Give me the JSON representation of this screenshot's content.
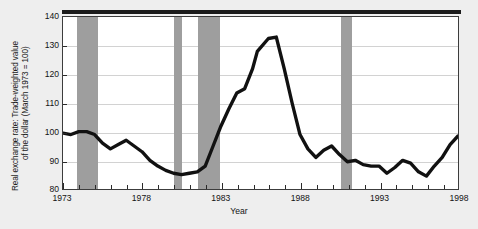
{
  "chart_data": {
    "type": "line",
    "title": "",
    "xlabel": "Year",
    "ylabel": "Real exchange rate: Trade-weighted value of the dollar (March 1973 = 100)",
    "ylabel_line1": "Real exchange rate: Trade-weighted value",
    "ylabel_line2": "of the dollar (March 1973 = 100)",
    "xlim": [
      1973,
      1998
    ],
    "ylim": [
      80,
      140
    ],
    "yticks": [
      140,
      130,
      120,
      110,
      100,
      90,
      80
    ],
    "xticks": [
      1973,
      1978,
      1983,
      1988,
      1993,
      1998
    ],
    "xtick_labels": [
      "1973",
      "1978",
      "1983",
      "1988",
      "1993",
      "1998"
    ],
    "ytick_labels": [
      "140",
      "130",
      "120",
      "110",
      "100",
      "90",
      "80"
    ],
    "grid": "horizontal",
    "legend": "none",
    "line_color": "#111111",
    "band_color": "#9e9e9e",
    "plot_bg": "#ffffff",
    "figure_bg": "#eeeeee",
    "series": [
      {
        "name": "Real trade-weighted value of the dollar",
        "x": [
          1973.0,
          1973.5,
          1974.0,
          1974.5,
          1975.0,
          1975.5,
          1976.0,
          1976.5,
          1977.0,
          1977.5,
          1978.0,
          1978.5,
          1979.0,
          1979.5,
          1980.0,
          1980.5,
          1981.0,
          1981.5,
          1982.0,
          1982.5,
          1983.0,
          1983.5,
          1984.0,
          1984.5,
          1985.0,
          1985.3,
          1986.0,
          1986.5,
          1987.0,
          1987.5,
          1988.0,
          1988.5,
          1989.0,
          1989.5,
          1990.0,
          1990.5,
          1991.0,
          1991.5,
          1992.0,
          1992.5,
          1993.0,
          1993.5,
          1994.0,
          1994.5,
          1995.0,
          1995.5,
          1996.0,
          1996.5,
          1997.0,
          1997.5,
          1998.0
        ],
        "y": [
          99.5,
          99.0,
          100.0,
          100.0,
          99.0,
          96.0,
          94.0,
          95.5,
          97.0,
          95.0,
          93.0,
          90.0,
          88.0,
          86.5,
          85.5,
          85.0,
          85.5,
          86.0,
          88.0,
          95.0,
          102.0,
          108.0,
          113.5,
          115.0,
          122.0,
          128.0,
          132.5,
          133.0,
          122.0,
          110.0,
          99.0,
          94.0,
          91.0,
          93.5,
          95.0,
          92.0,
          89.5,
          90.0,
          88.5,
          88.0,
          88.0,
          85.5,
          87.5,
          90.0,
          89.0,
          86.0,
          84.5,
          88.0,
          91.0,
          95.5,
          98.5
        ]
      }
    ],
    "shaded_regions": [
      {
        "label": "recession",
        "start": 1973.9,
        "end": 1975.2
      },
      {
        "label": "recession",
        "start": 1980.0,
        "end": 1980.5
      },
      {
        "label": "recession",
        "start": 1981.5,
        "end": 1982.9
      },
      {
        "label": "recession",
        "start": 1990.5,
        "end": 1991.2
      }
    ]
  },
  "axes": {
    "xlabel": "Year",
    "ylabel_line1": "Real exchange rate: Trade-weighted value",
    "ylabel_line2": "of the dollar (March 1973 = 100)"
  },
  "caption": {
    "text": ""
  }
}
